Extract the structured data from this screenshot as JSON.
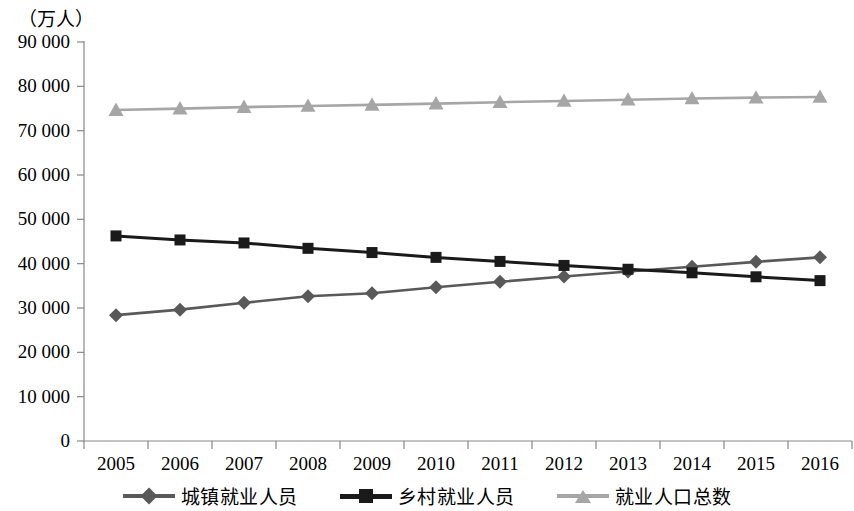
{
  "chart_data": {
    "type": "line",
    "title": "",
    "subtitle": "",
    "xlabel": "",
    "ylabel": "（万人）",
    "unit_label": "（万人）",
    "categories": [
      "2005",
      "2006",
      "2007",
      "2008",
      "2009",
      "2010",
      "2011",
      "2012",
      "2013",
      "2014",
      "2015",
      "2016"
    ],
    "ytick_labels": [
      "0",
      "10 000",
      "20 000",
      "30 000",
      "40 000",
      "50 000",
      "60 000",
      "70 000",
      "80 000",
      "90 000"
    ],
    "ytick_values": [
      0,
      10000,
      20000,
      30000,
      40000,
      50000,
      60000,
      70000,
      80000,
      90000
    ],
    "ylim": [
      0,
      90000
    ],
    "grid": false,
    "legend_position": "bottom",
    "series": [
      {
        "name": "城镇就业人员",
        "marker": "diamond",
        "color": "#595959",
        "values": [
          28389,
          29630,
          31176,
          32635,
          33322,
          34687,
          35914,
          37102,
          38240,
          39310,
          40410,
          41428
        ]
      },
      {
        "name": "乡村就业人员",
        "marker": "square",
        "color": "#1a1a1a",
        "values": [
          46258,
          45348,
          44674,
          43461,
          42506,
          41418,
          40506,
          39602,
          38737,
          37943,
          37041,
          36175
        ]
      },
      {
        "name": "就业人口总数",
        "marker": "triangle",
        "color": "#a6a6a6",
        "values": [
          74647,
          74978,
          75321,
          75564,
          75828,
          76105,
          76420,
          76704,
          76977,
          77253,
          77451,
          77603
        ]
      }
    ]
  },
  "legend": {
    "items": [
      {
        "label": "城镇就业人员",
        "marker": "diamond-marker",
        "color": "#595959"
      },
      {
        "label": "乡村就业人员",
        "marker": "square-marker",
        "color": "#1a1a1a"
      },
      {
        "label": "就业人口总数",
        "marker": "triangle-marker",
        "color": "#a6a6a6"
      }
    ]
  },
  "axis": {
    "unit": "（万人）"
  }
}
